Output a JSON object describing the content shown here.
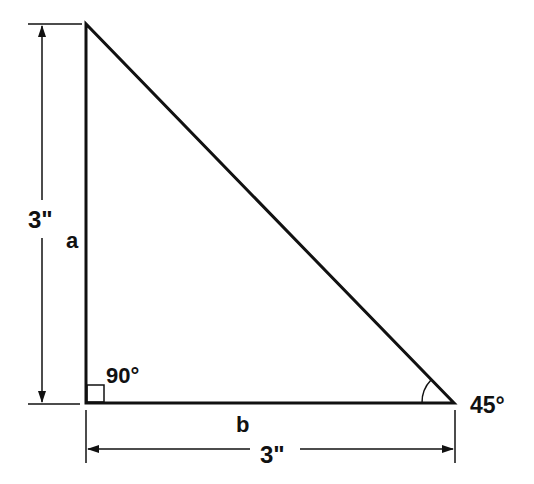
{
  "diagram": {
    "type": "right-triangle",
    "stroke_color": "#111111",
    "background": "#ffffff",
    "labels": {
      "side_a": "a",
      "side_b": "b",
      "height_dimension": "3\"",
      "base_dimension": "3\"",
      "right_angle": "90°",
      "acute_angle": "45°"
    }
  }
}
